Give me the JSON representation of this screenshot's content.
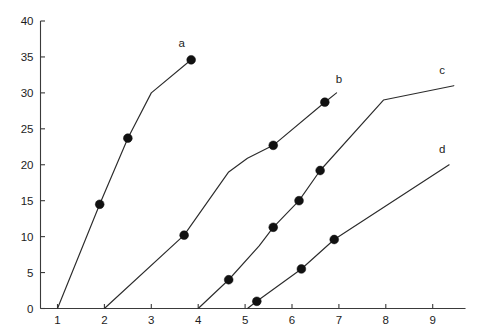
{
  "chart_data": {
    "type": "line",
    "title": "",
    "subtitle": "",
    "xlabel": "",
    "ylabel": "",
    "xlim": [
      0.5,
      9.7
    ],
    "ylim": [
      0,
      40
    ],
    "xticks": [
      1,
      2,
      3,
      4,
      5,
      6,
      7,
      8,
      9
    ],
    "yticks": [
      0,
      5,
      10,
      15,
      20,
      25,
      30,
      35,
      40
    ],
    "xtick_labels": [
      "1",
      "2",
      "3",
      "4",
      "5",
      "6",
      "7",
      "8",
      "9"
    ],
    "ytick_labels": [
      "0",
      "5",
      "10",
      "15",
      "20",
      "25",
      "30",
      "35",
      "40"
    ],
    "grid": false,
    "legend": "inline-curve-labels",
    "line_color": "#2b2b2b",
    "marker_color": "#111111",
    "axis_color": "#3a3a3a",
    "background": "#ffffff",
    "series": [
      {
        "name": "a",
        "label": "a",
        "label_x": 3.65,
        "label_y": 36.4,
        "x": [
          1.0,
          1.9,
          2.5,
          3.0,
          3.85
        ],
        "y": [
          0.0,
          14.5,
          23.7,
          30.0,
          34.6
        ],
        "markers": [
          {
            "x": 1.9,
            "y": 14.5
          },
          {
            "x": 2.5,
            "y": 23.7
          },
          {
            "x": 3.85,
            "y": 34.6
          }
        ]
      },
      {
        "name": "b",
        "label": "b",
        "label_x": 7.0,
        "label_y": 31.4,
        "x": [
          2.0,
          3.7,
          4.65,
          5.05,
          5.6,
          6.7,
          6.95
        ],
        "y": [
          0.0,
          10.2,
          19.0,
          20.9,
          22.7,
          28.7,
          30.0
        ],
        "markers": [
          {
            "x": 3.7,
            "y": 10.2
          },
          {
            "x": 5.6,
            "y": 22.7
          },
          {
            "x": 6.7,
            "y": 28.7
          }
        ]
      },
      {
        "name": "c",
        "label": "c",
        "label_x": 9.2,
        "label_y": 32.6,
        "x": [
          4.0,
          4.65,
          5.3,
          5.6,
          6.15,
          6.6,
          7.95,
          9.45
        ],
        "y": [
          0.0,
          4.0,
          8.7,
          11.3,
          15.0,
          19.2,
          29.0,
          31.0
        ],
        "markers": [
          {
            "x": 4.65,
            "y": 4.0
          },
          {
            "x": 5.6,
            "y": 11.3
          },
          {
            "x": 6.15,
            "y": 15.0
          },
          {
            "x": 6.6,
            "y": 19.2
          }
        ]
      },
      {
        "name": "d",
        "label": "d",
        "label_x": 9.2,
        "label_y": 21.6,
        "x": [
          5.05,
          5.25,
          6.2,
          6.9,
          9.35
        ],
        "y": [
          0.0,
          1.0,
          5.5,
          9.6,
          20.0
        ],
        "markers": [
          {
            "x": 5.25,
            "y": 1.0
          },
          {
            "x": 6.2,
            "y": 5.5
          },
          {
            "x": 6.9,
            "y": 9.6
          }
        ]
      }
    ]
  },
  "meta": {
    "marker_radius_px": 4.4
  }
}
